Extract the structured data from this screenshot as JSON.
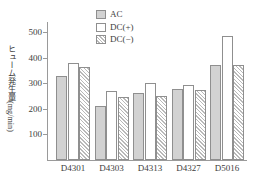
{
  "chart_data": {
    "type": "bar",
    "title": "",
    "xlabel": "",
    "ylabel": "ヒューム発生量(mg/min)",
    "ylim": [
      0,
      540
    ],
    "yticks": [
      100,
      200,
      300,
      400,
      500
    ],
    "ytick_labels": [
      "100",
      "200",
      "300",
      "400",
      "500"
    ],
    "grid": false,
    "legend_position": "top-center",
    "categories": [
      "D4301",
      "D4303",
      "D4313",
      "D4327",
      "D5016"
    ],
    "series": [
      {
        "name": "AC",
        "style": "gray-fill",
        "color": "#d2d2d2",
        "values": [
          330,
          211,
          264,
          278,
          371
        ]
      },
      {
        "name": "DC(+)",
        "style": "white-fill",
        "color": "#ffffff",
        "values": [
          378,
          271,
          301,
          292,
          487
        ]
      },
      {
        "name": "DC(−)",
        "style": "hatch-fill",
        "color": "#b9b9b9",
        "values": [
          365,
          245,
          250,
          273,
          370
        ]
      }
    ]
  },
  "legend": {
    "items": [
      {
        "label": "AC"
      },
      {
        "label": "DC(+)"
      },
      {
        "label": "DC(−)"
      }
    ]
  },
  "axes": {
    "y_axis_title": "ヒューム発生量(mg/min)"
  },
  "colors": {
    "axis": "#9a9a9a",
    "bar_border": "#8f8f8f",
    "text": "#3d3d3d",
    "background": "#ffffff"
  }
}
